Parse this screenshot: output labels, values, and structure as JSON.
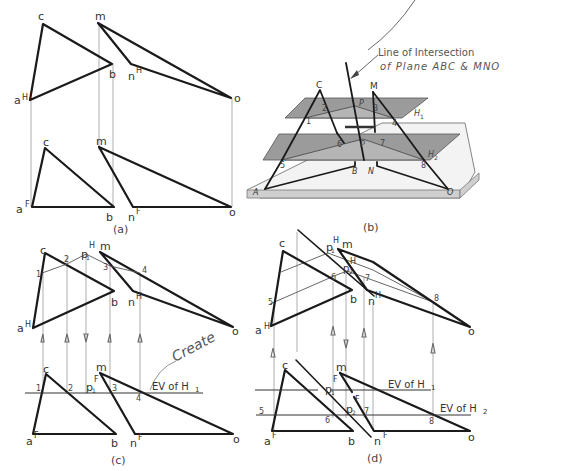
{
  "figure": {
    "panels": [
      {
        "id": "a",
        "caption": "(a)"
      },
      {
        "id": "b",
        "caption": "(b)"
      },
      {
        "id": "c",
        "caption": "(c)"
      },
      {
        "id": "d",
        "caption": "(d)"
      }
    ],
    "panel_a": {
      "top_labels": {
        "c": "c",
        "m": "m",
        "b": "b",
        "n": "n",
        "n_sup": "H",
        "a": "a",
        "a_sup": "H",
        "o": "o"
      },
      "bottom_labels": {
        "c": "c",
        "m": "m",
        "a": "a",
        "a_sup": "F",
        "b": "b",
        "n": "n",
        "n_sup": "F",
        "o": "o"
      }
    },
    "panel_b": {
      "annotation_line1": "Line of Intersection",
      "annotation_line2": "of Plane ABC & MNO",
      "vertex_labels": {
        "C": "C",
        "M": "M",
        "A": "A",
        "B": "B",
        "N": "N",
        "O": "O"
      },
      "points": {
        "p1": "1",
        "p2": "2",
        "p3": "3",
        "p4": "4",
        "p5": "5",
        "p6": "6",
        "p7": "7",
        "p8": "8"
      },
      "intersection_points": {
        "P1": "P",
        "P1_sub": "1",
        "P2": "P",
        "P2_sub": "2"
      },
      "planes": {
        "H1": "H",
        "H1_sub": "1",
        "H2": "H",
        "H2_sub": "2"
      }
    },
    "panel_c": {
      "top_labels": {
        "c": "c",
        "p": "p",
        "p_sub": "1",
        "p_sup": "H",
        "m": "m",
        "one": "1",
        "two": "2",
        "three": "3",
        "four": "4",
        "b": "b",
        "n": "n",
        "n_sup": "H",
        "a": "a",
        "a_sup": "H",
        "o": "o"
      },
      "bottom_labels": {
        "c": "c",
        "m": "m",
        "one": "1",
        "two": "2",
        "p": "p",
        "p_sub": "1",
        "p_sup": "F",
        "three": "3",
        "four": "4",
        "a": "a",
        "a_sup": "F",
        "b": "b",
        "n": "n",
        "n_sup": "F",
        "o": "o"
      },
      "ev_label": "EV of H",
      "ev_sub": "1",
      "handwritten_note": "Create"
    },
    "panel_d": {
      "top_labels": {
        "c": "c",
        "p1": "p",
        "p1_sub": "1",
        "p1_sup": "H",
        "m": "m",
        "h": "H",
        "p2": "p",
        "p2_sub": "2",
        "six": "6",
        "seven": "7",
        "five": "5",
        "eight": "8",
        "b": "b",
        "n": "n",
        "n_sup": "H",
        "a": "a",
        "a_sup": "H",
        "o": "o"
      },
      "bottom_labels": {
        "c": "c",
        "m": "m",
        "p1": "p",
        "p1_sub": "1",
        "p1_sup": "F",
        "p2": "p",
        "p2_sub": "2",
        "p2_sup": "F",
        "five": "5",
        "six": "6",
        "seven": "7",
        "eight": "8",
        "a": "a",
        "a_sup": "F",
        "b": "b",
        "n": "n",
        "n_sup": "F",
        "o": "o"
      },
      "ev1_label": "EV of H",
      "ev1_sub": "1",
      "ev2_label": "EV of H",
      "ev2_sub": "2"
    }
  }
}
